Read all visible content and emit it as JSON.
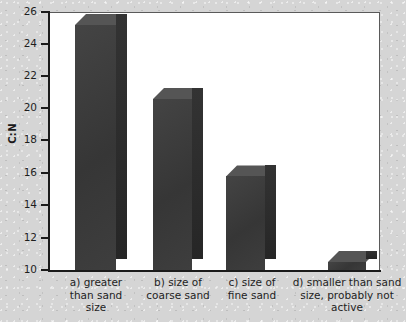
{
  "chart_data": {
    "type": "bar",
    "title": "",
    "subtitle": "",
    "xlabel": "",
    "ylabel": "C:N",
    "ylim": [
      10,
      26
    ],
    "grid": false,
    "legend": null,
    "yticks": [
      26,
      24,
      22,
      20,
      18,
      16,
      14,
      12,
      10
    ],
    "categories": [
      "a) greater than sand size",
      "b) size of coarse sand",
      "c) size of fine sand",
      "d) smaller than sand size, probably not active"
    ],
    "values": [
      25.2,
      20.6,
      15.8,
      10.5
    ],
    "bar_style": "3d",
    "bar_color": "#3b3b3b",
    "plot_background": "#ffffff",
    "page_background": "#d5d5d5"
  },
  "axis": {
    "y_title": "C:N",
    "tick_labels": [
      "26",
      "24",
      "22",
      "20",
      "18",
      "16",
      "14",
      "12",
      "10"
    ]
  },
  "categories_wrapped": [
    [
      "a) greater",
      "than sand",
      "size"
    ],
    [
      "b) size of",
      "coarse sand"
    ],
    [
      "c) size of",
      "fine sand"
    ],
    [
      "d) smaller than sand",
      "size, probably not",
      "active"
    ]
  ]
}
